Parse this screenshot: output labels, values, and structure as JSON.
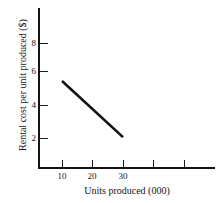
{
  "chart_data": {
    "type": "line",
    "title": "",
    "xlabel": "Units produced (000)",
    "ylabel": "Rental cost per unit produced ($)",
    "xlim": [
      0,
      58
    ],
    "ylim": [
      0,
      9.8
    ],
    "grid": false,
    "legend": null,
    "x_ticks": [
      {
        "value": 10,
        "label": "10"
      },
      {
        "value": 20,
        "label": "20"
      },
      {
        "value": 30,
        "label": "30"
      },
      {
        "value": 40,
        "label": ""
      },
      {
        "value": 50,
        "label": ""
      }
    ],
    "y_ticks": [
      {
        "value": 8,
        "label": "8"
      },
      {
        "value": 6,
        "label": "6"
      },
      {
        "value": 4,
        "label": "4"
      },
      {
        "value": 2,
        "label": "2"
      }
    ],
    "series": [
      {
        "name": "Rental cost",
        "x": [
          10,
          30
        ],
        "values": [
          5.4,
          2.05
        ]
      }
    ]
  },
  "axes": {
    "y_axis_name": "y-axis",
    "x_axis_name": "x-axis"
  }
}
